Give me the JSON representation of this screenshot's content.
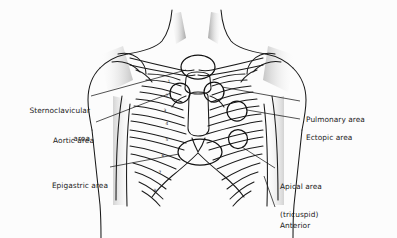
{
  "figure": {
    "background_color": "#fcfcfc",
    "line_color": "#1a1a1a",
    "text_color": "#1b1b1b",
    "shade_color": "#9a9a9a"
  },
  "labels": {
    "sternoclavicular": {
      "line1": "Sternoclavicular",
      "line2": "area"
    },
    "aortic": {
      "line1": "Aortic area"
    },
    "epigastric": {
      "line1": "Epigastric area"
    },
    "pulmonary": {
      "line1": "Pulmonary area"
    },
    "ectopic": {
      "line1": "Ectopic area"
    },
    "apical": {
      "line1": "Apical area",
      "line2": "(tricuspid)"
    },
    "anterior_precordium": {
      "line1": "Anterior",
      "line2": "precordium area"
    }
  },
  "rib_numbers": [
    "1",
    "2",
    "3",
    "4",
    "5",
    "6",
    "7",
    "8"
  ],
  "markers": [
    {
      "name": "sternoclavicular-marker",
      "cx": 198,
      "cy": 67,
      "rx": 17,
      "ry": 12
    },
    {
      "name": "aortic-marker",
      "cx": 180,
      "cy": 93,
      "rx": 10,
      "ry": 10
    },
    {
      "name": "pulmonary-marker",
      "cx": 214,
      "cy": 92,
      "rx": 10,
      "ry": 10
    },
    {
      "name": "ectopic-marker",
      "cx": 237,
      "cy": 111,
      "rx": 10,
      "ry": 10
    },
    {
      "name": "apical-marker",
      "cx": 238,
      "cy": 139,
      "rx": 9.5,
      "ry": 9.5
    },
    {
      "name": "epigastric-marker",
      "cx": 200,
      "cy": 152,
      "rx": 22,
      "ry": 13
    }
  ]
}
